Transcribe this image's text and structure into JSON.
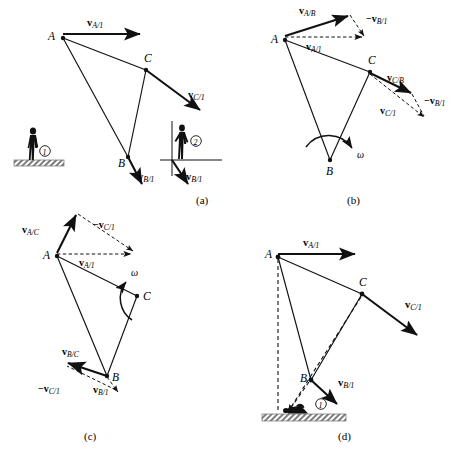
{
  "figure": {
    "domain": "kinematics-vector-diagram",
    "background_color": "#ffffff",
    "ink_color": "#111111",
    "ground_color": "#8a8a8a",
    "panels": [
      {
        "id": "a",
        "caption": "(a)",
        "points": [
          {
            "name": "A",
            "label": "A"
          },
          {
            "name": "B",
            "label": "B"
          },
          {
            "name": "C",
            "label": "C"
          }
        ],
        "vectors": [
          {
            "name": "v-A-1",
            "label": "v",
            "sub": "A/1",
            "style": "solid"
          },
          {
            "name": "v-C-1",
            "label": "v",
            "sub": "C/1",
            "style": "solid"
          },
          {
            "name": "v-B-1",
            "label": "v",
            "sub": "B/1",
            "style": "solid"
          },
          {
            "name": "v-B-1-observer2",
            "label": "v",
            "sub": "B/1",
            "style": "solid"
          }
        ],
        "observers": [
          {
            "name": "observer-1",
            "label": "1",
            "stance": "standing-on-ground"
          },
          {
            "name": "observer-2",
            "label": "2",
            "stance": "standing-on-axes"
          }
        ]
      },
      {
        "id": "b",
        "caption": "(b)",
        "points": [
          {
            "name": "A",
            "label": "A"
          },
          {
            "name": "B",
            "label": "B"
          },
          {
            "name": "C",
            "label": "C"
          }
        ],
        "vectors": [
          {
            "name": "v-A-B",
            "label": "v",
            "sub": "A/B",
            "style": "solid"
          },
          {
            "name": "neg-v-B-1-top",
            "label": "−v",
            "sub": "B/1",
            "style": "dashed"
          },
          {
            "name": "v-A-1",
            "label": "v",
            "sub": "A/1",
            "style": "dashed"
          },
          {
            "name": "v-C-B",
            "label": "v",
            "sub": "C/B",
            "style": "solid"
          },
          {
            "name": "v-C-1",
            "label": "v",
            "sub": "C/1",
            "style": "dashed"
          },
          {
            "name": "neg-v-B-1-right",
            "label": "−v",
            "sub": "B/1",
            "style": "dashed"
          }
        ],
        "rotation": {
          "name": "omega-arc",
          "label": "ω",
          "center": "B",
          "sense": "clockwise"
        }
      },
      {
        "id": "c",
        "caption": "(c)",
        "points": [
          {
            "name": "A",
            "label": "A"
          },
          {
            "name": "B",
            "label": "B"
          },
          {
            "name": "C",
            "label": "C"
          }
        ],
        "vectors": [
          {
            "name": "v-A-C",
            "label": "v",
            "sub": "A/C",
            "style": "solid"
          },
          {
            "name": "neg-v-C-1-top",
            "label": "−v",
            "sub": "C/1",
            "style": "dashed"
          },
          {
            "name": "v-A-1",
            "label": "v",
            "sub": "A/1",
            "style": "dashed"
          },
          {
            "name": "v-B-C",
            "label": "v",
            "sub": "B/C",
            "style": "solid"
          },
          {
            "name": "neg-v-C-1-bottom",
            "label": "−v",
            "sub": "C/1",
            "style": "dashed"
          },
          {
            "name": "v-B-1",
            "label": "v",
            "sub": "B/1",
            "style": "dashed"
          }
        ],
        "rotation": {
          "name": "omega-arc",
          "label": "ω",
          "center": "C",
          "sense": "counterclockwise"
        }
      },
      {
        "id": "d",
        "caption": "(d)",
        "points": [
          {
            "name": "A",
            "label": "A"
          },
          {
            "name": "B",
            "label": "B"
          },
          {
            "name": "C",
            "label": "C"
          }
        ],
        "vectors": [
          {
            "name": "v-A-1",
            "label": "v",
            "sub": "A/1",
            "style": "solid"
          },
          {
            "name": "v-C-1",
            "label": "v",
            "sub": "C/1",
            "style": "solid"
          },
          {
            "name": "v-B-1",
            "label": "v",
            "sub": "B/1",
            "style": "solid"
          }
        ],
        "observers": [
          {
            "name": "observer-1",
            "label": "1",
            "stance": "lying-on-ground"
          }
        ],
        "construction_lines": [
          {
            "name": "dashed-vertical-from-A",
            "style": "dashed"
          },
          {
            "name": "dashed-line-to-C",
            "style": "dashed"
          },
          {
            "name": "dashed-line-to-B",
            "style": "dashed"
          }
        ]
      }
    ]
  }
}
